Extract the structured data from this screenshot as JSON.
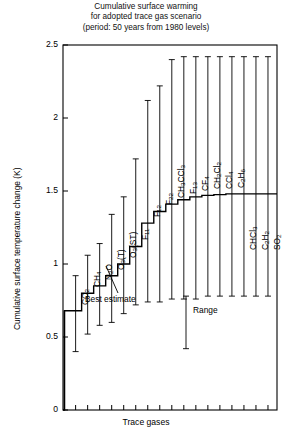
{
  "chart_data": {
    "type": "bar",
    "title": "Cumulative surface warming",
    "subtitle": "for adopted trace gas scenario",
    "subtitle2": "(period: 50 years from 1980 levels)",
    "xlabel": "Trace gases",
    "ylabel": "Cumulative surface temperature change (K)",
    "ylim": [
      0,
      2.5
    ],
    "yticks": [
      "0",
      "0.5",
      "1",
      "1.5",
      "2",
      "2.5"
    ],
    "ytick_values": [
      0,
      0.5,
      1,
      1.5,
      2,
      2.5
    ],
    "grid": false,
    "legend": "none",
    "style": "cumulative staircase with range error bars",
    "categories": [
      "CO2",
      "CH4",
      "N2O",
      "O3(T)",
      "O3(ST)",
      "F11",
      "F12",
      "F22",
      "CH3CCl3",
      "F13",
      "CF4",
      "CH2Cl2",
      "CCl4",
      "C2H6",
      "CHCl3",
      "C2H2",
      "SO2"
    ],
    "category_labels_html": [
      "CO<sub>2</sub>",
      "CH<sub>4</sub>",
      "N<sub>2</sub>O",
      "O<sub>3</sub>(T)",
      "O<sub>3</sub>(ST)",
      "F<sub>11</sub>",
      "F<sub>12</sub>",
      "F<sub>22</sub>",
      "CH<sub>3</sub>CCl<sub>3</sub>",
      "F<sub>13</sub>",
      "CF<sub>4</sub>",
      "CH<sub>2</sub>Cl<sub>2</sub>",
      "CCl<sub>4</sub>",
      "C<sub>2</sub>H<sub>6</sub>",
      "CHCl<sub>3</sub>",
      "C<sub>2</sub>H<sub>2</sub>",
      "SO<sub>2</sub>"
    ],
    "label_side": [
      "above",
      "above",
      "above",
      "above",
      "above",
      "above",
      "above",
      "above",
      "above",
      "above",
      "above",
      "above",
      "above",
      "above",
      "below",
      "below",
      "below"
    ],
    "cumulative_best_estimate": [
      0.68,
      0.8,
      0.85,
      0.92,
      1.0,
      1.12,
      1.28,
      1.36,
      1.41,
      1.44,
      1.46,
      1.47,
      1.475,
      1.48,
      1.48,
      1.48,
      1.48
    ],
    "range_low": [
      0.4,
      0.52,
      0.58,
      0.6,
      0.66,
      0.72,
      0.74,
      0.74,
      0.76,
      0.76,
      0.76,
      0.78,
      0.78,
      0.78,
      0.78,
      0.78,
      0.78
    ],
    "range_high": [
      0.92,
      1.06,
      1.14,
      1.34,
      1.46,
      1.72,
      2.12,
      2.22,
      2.4,
      2.42,
      2.42,
      2.42,
      2.42,
      2.42,
      2.42,
      2.42,
      2.42
    ],
    "annotations": {
      "best_estimate": "Best estimate",
      "range": "Range"
    }
  }
}
